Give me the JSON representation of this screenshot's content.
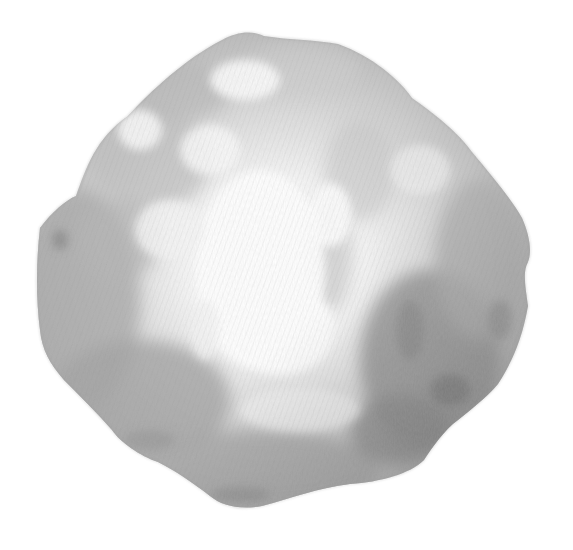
{
  "image": {
    "subject": "rock",
    "style": "grayscale pencil/charcoal illustration",
    "background_color": "#ffffff",
    "colors": {
      "highlight": "#ffffff",
      "light": "#e6e6e6",
      "mid": "#bdbdbd",
      "shadow": "#9a9a9a",
      "deep_shadow": "#7f7f7f"
    }
  }
}
